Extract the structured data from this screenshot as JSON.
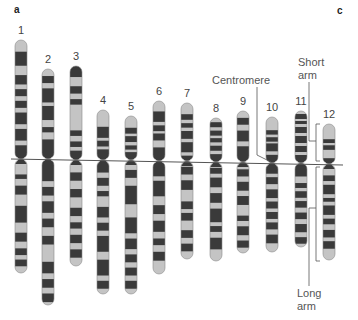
{
  "figure": {
    "panel_labels": {
      "left": "a",
      "right": "c"
    },
    "annotations": {
      "centromere": "Centromere",
      "short_arm": [
        "Short",
        "arm"
      ],
      "long_arm": [
        "Long",
        "arm"
      ]
    },
    "colors": {
      "dark_band": "#3a3a3a",
      "light_band": "#c4c4c4",
      "outline": "#8a8a8a",
      "line": "#555555"
    },
    "chromosomes": [
      {
        "id": "1",
        "x": 21,
        "top": 40,
        "cen": 159,
        "bottom": 273,
        "p_bands": [
          [
            0.1,
            0.22
          ],
          [
            0.3,
            0.38
          ],
          [
            0.42,
            0.48
          ],
          [
            0.52,
            0.58
          ],
          [
            0.62,
            0.72
          ],
          [
            0.76,
            0.86
          ],
          [
            0.9,
            1.0
          ]
        ],
        "q_bands": [
          [
            0.12,
            0.16
          ],
          [
            0.22,
            0.3
          ],
          [
            0.4,
            0.55
          ],
          [
            0.64,
            0.72
          ],
          [
            0.78,
            0.84
          ],
          [
            0.88,
            0.94
          ]
        ]
      },
      {
        "id": "2",
        "x": 48,
        "top": 69,
        "cen": 159,
        "bottom": 305,
        "p_bands": [
          [
            0.08,
            0.16
          ],
          [
            0.22,
            0.38
          ],
          [
            0.42,
            0.58
          ],
          [
            0.66,
            0.72
          ],
          [
            0.8,
            1.0
          ]
        ],
        "q_bands": [
          [
            0.0,
            0.14
          ],
          [
            0.18,
            0.24
          ],
          [
            0.28,
            0.36
          ],
          [
            0.4,
            0.46
          ],
          [
            0.52,
            0.58
          ],
          [
            0.7,
            0.78
          ],
          [
            0.82,
            0.88
          ],
          [
            0.92,
            0.98
          ]
        ]
      },
      {
        "id": "3",
        "x": 76,
        "top": 66,
        "cen": 160,
        "bottom": 266,
        "p_bands": [
          [
            0.0,
            0.12
          ],
          [
            0.22,
            0.3
          ],
          [
            0.36,
            0.42
          ],
          [
            0.7,
            0.76
          ],
          [
            0.82,
            0.88
          ],
          [
            0.92,
            1.0
          ]
        ],
        "q_bands": [
          [
            0.1,
            0.18
          ],
          [
            0.26,
            0.34
          ],
          [
            0.44,
            0.52
          ],
          [
            0.58,
            0.64
          ],
          [
            0.7,
            0.78
          ],
          [
            0.84,
            0.92
          ]
        ]
      },
      {
        "id": "4",
        "x": 103,
        "top": 110,
        "cen": 160,
        "bottom": 294,
        "p_bands": [
          [
            0.35,
            0.58
          ],
          [
            0.64,
            0.76
          ],
          [
            0.82,
            1.0
          ]
        ],
        "q_bands": [
          [
            0.02,
            0.08
          ],
          [
            0.12,
            0.18
          ],
          [
            0.22,
            0.26
          ],
          [
            0.34,
            0.42
          ],
          [
            0.46,
            0.52
          ],
          [
            0.56,
            0.68
          ],
          [
            0.74,
            0.86
          ],
          [
            0.9,
            0.96
          ]
        ]
      },
      {
        "id": "5",
        "x": 131,
        "top": 116,
        "cen": 160,
        "bottom": 294,
        "p_bands": [
          [
            0.28,
            0.42
          ],
          [
            0.48,
            0.62
          ],
          [
            0.7,
            0.8
          ],
          [
            0.86,
            1.0
          ]
        ],
        "q_bands": [
          [
            0.06,
            0.12
          ],
          [
            0.18,
            0.32
          ],
          [
            0.42,
            0.54
          ],
          [
            0.58,
            0.66
          ],
          [
            0.7,
            0.76
          ],
          [
            0.8,
            0.86
          ],
          [
            0.9,
            0.96
          ]
        ]
      },
      {
        "id": "6",
        "x": 159,
        "top": 101,
        "cen": 161,
        "bottom": 274,
        "p_bands": [
          [
            0.18,
            0.36
          ],
          [
            0.42,
            0.52
          ],
          [
            0.56,
            0.68
          ],
          [
            0.8,
            1.0
          ]
        ],
        "q_bands": [
          [
            0.0,
            0.12
          ],
          [
            0.16,
            0.3
          ],
          [
            0.38,
            0.46
          ],
          [
            0.52,
            0.62
          ],
          [
            0.68,
            0.74
          ],
          [
            0.8,
            0.88
          ]
        ]
      },
      {
        "id": "7",
        "x": 187,
        "top": 103,
        "cen": 161,
        "bottom": 259,
        "p_bands": [
          [
            0.2,
            0.3
          ],
          [
            0.36,
            0.44
          ],
          [
            0.5,
            0.64
          ],
          [
            0.7,
            0.88
          ],
          [
            0.94,
            1.0
          ]
        ],
        "q_bands": [
          [
            0.04,
            0.12
          ],
          [
            0.18,
            0.28
          ],
          [
            0.4,
            0.48
          ],
          [
            0.52,
            0.6
          ],
          [
            0.7,
            0.78
          ],
          [
            0.84,
            0.92
          ]
        ]
      },
      {
        "id": "8",
        "x": 216,
        "top": 118,
        "cen": 162,
        "bottom": 261,
        "p_bands": [
          [
            0.1,
            0.22
          ],
          [
            0.3,
            0.42
          ],
          [
            0.48,
            0.58
          ],
          [
            0.66,
            0.78
          ],
          [
            0.86,
            1.0
          ]
        ],
        "q_bands": [
          [
            0.04,
            0.1
          ],
          [
            0.14,
            0.24
          ],
          [
            0.3,
            0.4
          ],
          [
            0.46,
            0.6
          ],
          [
            0.64,
            0.7
          ],
          [
            0.76,
            0.88
          ]
        ]
      },
      {
        "id": "9",
        "x": 243,
        "top": 111,
        "cen": 162,
        "bottom": 253,
        "p_bands": [
          [
            0.14,
            0.28
          ],
          [
            0.4,
            0.62
          ],
          [
            0.72,
            1.0
          ]
        ],
        "q_bands": [
          [
            0.06,
            0.14
          ],
          [
            0.2,
            0.3
          ],
          [
            0.36,
            0.46
          ],
          [
            0.58,
            0.64
          ],
          [
            0.7,
            0.8
          ],
          [
            0.86,
            0.94
          ]
        ]
      },
      {
        "id": "10",
        "x": 272,
        "top": 117,
        "cen": 163,
        "bottom": 252,
        "p_bands": [
          [
            0.3,
            0.4
          ],
          [
            0.46,
            0.56
          ],
          [
            0.6,
            0.78
          ],
          [
            0.86,
            1.0
          ]
        ],
        "q_bands": [
          [
            0.02,
            0.1
          ],
          [
            0.14,
            0.22
          ],
          [
            0.28,
            0.38
          ],
          [
            0.42,
            0.5
          ],
          [
            0.54,
            0.62
          ],
          [
            0.66,
            0.74
          ],
          [
            0.8,
            0.9
          ]
        ]
      },
      {
        "id": "11",
        "x": 301,
        "top": 111,
        "cen": 163,
        "bottom": 247,
        "p_bands": [
          [
            0.06,
            0.16
          ],
          [
            0.2,
            0.26
          ],
          [
            0.32,
            0.44
          ],
          [
            0.5,
            0.64
          ],
          [
            0.7,
            0.82
          ],
          [
            0.88,
            1.0
          ]
        ],
        "q_bands": [
          [
            0.0,
            0.14
          ],
          [
            0.22,
            0.28
          ],
          [
            0.32,
            0.4
          ],
          [
            0.44,
            0.52
          ],
          [
            0.58,
            0.66
          ],
          [
            0.72,
            0.82
          ],
          [
            0.88,
            0.96
          ]
        ]
      },
      {
        "id": "12",
        "x": 329,
        "top": 124,
        "cen": 164,
        "bottom": 260,
        "p_bands": [
          [
            0.4,
            0.5
          ],
          [
            0.56,
            0.68
          ],
          [
            0.9,
            1.0
          ]
        ],
        "q_bands": [
          [
            0.1,
            0.16
          ],
          [
            0.2,
            0.3
          ],
          [
            0.34,
            0.38
          ],
          [
            0.42,
            0.52
          ],
          [
            0.56,
            0.62
          ],
          [
            0.68,
            0.76
          ],
          [
            0.8,
            0.88
          ]
        ]
      }
    ]
  }
}
